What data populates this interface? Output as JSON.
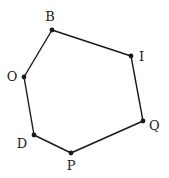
{
  "diagram": {
    "type": "polygon",
    "shape": "heptagon-like hexagon",
    "vertices": [
      {
        "name": "B",
        "x": 52,
        "y": 30,
        "label_x": 50,
        "label_y": 21,
        "anchor": "middle"
      },
      {
        "name": "I",
        "x": 131,
        "y": 56,
        "label_x": 139,
        "label_y": 61,
        "anchor": "start"
      },
      {
        "name": "Q",
        "x": 143,
        "y": 121,
        "label_x": 149,
        "label_y": 130,
        "anchor": "start"
      },
      {
        "name": "P",
        "x": 71,
        "y": 153,
        "label_x": 71,
        "label_y": 170,
        "anchor": "middle"
      },
      {
        "name": "D",
        "x": 34,
        "y": 135,
        "label_x": 22,
        "label_y": 148,
        "anchor": "middle"
      },
      {
        "name": "O",
        "x": 24,
        "y": 77,
        "label_x": 12,
        "label_y": 81,
        "anchor": "middle"
      }
    ],
    "edges": [
      [
        "B",
        "I"
      ],
      [
        "I",
        "Q"
      ],
      [
        "Q",
        "P"
      ],
      [
        "P",
        "D"
      ],
      [
        "D",
        "O"
      ],
      [
        "O",
        "B"
      ]
    ],
    "colors": {
      "stroke": "#1a1a1a",
      "background": "#ffffff"
    }
  }
}
